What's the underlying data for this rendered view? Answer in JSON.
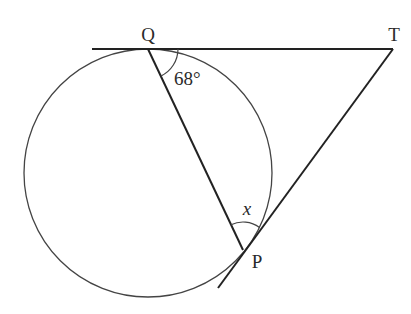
{
  "diagram": {
    "type": "circle-geometry",
    "colors": {
      "stroke": "#222222",
      "circle": "#444444",
      "text": "#2a2a2a",
      "background": "#ffffff"
    },
    "circle": {
      "cx": 148,
      "cy": 173,
      "r": 124
    },
    "points": {
      "Q": {
        "label": "Q",
        "x": 148,
        "y": 49
      },
      "T": {
        "label": "T",
        "x": 393,
        "y": 49
      },
      "P": {
        "label": "P",
        "x": 243,
        "y": 250
      }
    },
    "lines": [
      {
        "name": "tangent-at-Q",
        "from": [
          92,
          49
        ],
        "to": [
          393,
          49
        ]
      },
      {
        "name": "tangent-TP",
        "from": [
          393,
          49
        ],
        "to": [
          218,
          288
        ]
      },
      {
        "name": "chord-QP",
        "from": [
          148,
          49
        ],
        "to": [
          243,
          250
        ]
      }
    ],
    "angles": {
      "angle_TQP": {
        "label": "68°",
        "vertex": "Q"
      },
      "angle_QPT": {
        "label": "x",
        "vertex": "P"
      }
    }
  }
}
